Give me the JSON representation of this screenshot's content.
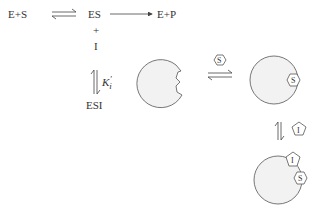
{
  "scheme": {
    "reactants": "E+S",
    "complex": "ES",
    "plus": "+",
    "inhibitor": "I",
    "product": "E+P",
    "constant": "K",
    "constant_sub": "i",
    "constant_prime": "′",
    "ternary": "ESI"
  },
  "cartoon": {
    "substrate_label": "S",
    "inhibitor_label": "I"
  },
  "colors": {
    "line": "#555555",
    "fill": "#f2f2f2",
    "text": "#333333"
  }
}
